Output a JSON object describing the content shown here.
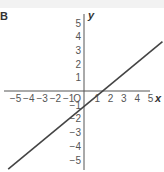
{
  "panel_label": "B",
  "chart_data": {
    "type": "line",
    "title": "",
    "xlabel": "x",
    "ylabel": "y",
    "xlim": [
      -5.5,
      5.5
    ],
    "ylim": [
      -5.5,
      5.5
    ],
    "x_ticks": [
      "-5",
      "-4",
      "-3",
      "-2",
      "-1",
      "1",
      "2",
      "3",
      "4",
      "5"
    ],
    "y_ticks": [
      "5",
      "4",
      "3",
      "2",
      "1",
      "-1",
      "-2",
      "-3",
      "-4",
      "-5"
    ],
    "origin_label": "O",
    "grid": false,
    "series": [
      {
        "name": "line",
        "x": [
          -5.7,
          5.9
        ],
        "y": [
          -5.7,
          3.6
        ],
        "color": "#444444"
      }
    ]
  }
}
